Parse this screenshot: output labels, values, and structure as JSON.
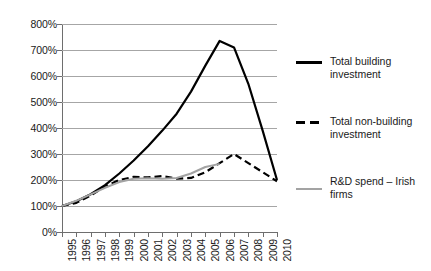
{
  "chart_data": {
    "type": "line",
    "title": "",
    "subtitle": "",
    "xlabel": "",
    "ylabel": "",
    "x": [
      1995,
      1996,
      1997,
      1998,
      1999,
      2000,
      2001,
      2002,
      2003,
      2004,
      2005,
      2006,
      2007,
      2008,
      2009,
      2010
    ],
    "categories": [
      "1995",
      "1996",
      "1997",
      "1998",
      "1999",
      "2000",
      "2001",
      "2002",
      "2003",
      "2004",
      "2005",
      "2006",
      "2007",
      "2008",
      "2009",
      "2010"
    ],
    "ylim": [
      0,
      800
    ],
    "xlim": [
      1995,
      2010
    ],
    "y_tick_labels": [
      "800%",
      "700%",
      "600%",
      "500%",
      "400%",
      "300%",
      "200%",
      "100%",
      "0%"
    ],
    "y_ticks": [
      800,
      700,
      600,
      500,
      400,
      300,
      200,
      100,
      0
    ],
    "y_unit": "%",
    "grid": true,
    "grid_axis": "y",
    "legend_position": "right",
    "series": [
      {
        "name": "Total building investment",
        "style": "solid",
        "color": "#000000",
        "width": 2.2,
        "values": [
          100,
          118,
          145,
          180,
          225,
          275,
          330,
          390,
          455,
          540,
          640,
          735,
          710,
          570,
          390,
          200
        ]
      },
      {
        "name": "Total non-building investment",
        "style": "dashed",
        "color": "#000000",
        "width": 2.2,
        "values": [
          100,
          112,
          140,
          175,
          200,
          212,
          210,
          215,
          205,
          208,
          230,
          265,
          300,
          265,
          230,
          195
        ]
      },
      {
        "name": "R&D spend – Irish firms",
        "style": "solid",
        "color": "#a3a3a3",
        "width": 2.0,
        "values": [
          100,
          120,
          145,
          170,
          192,
          205,
          207,
          205,
          208,
          225,
          250,
          262,
          null,
          null,
          null,
          null
        ]
      }
    ]
  },
  "legend": {
    "items": [
      {
        "label_line1": "Total building",
        "label_line2": "investment",
        "swatch": "solid-thick-black"
      },
      {
        "label_line1": "Total non-building",
        "label_line2": "investment",
        "swatch": "dashed-black"
      },
      {
        "label_line1": "R&D spend – Irish",
        "label_line2": "firms",
        "swatch": "solid-gray"
      }
    ]
  }
}
